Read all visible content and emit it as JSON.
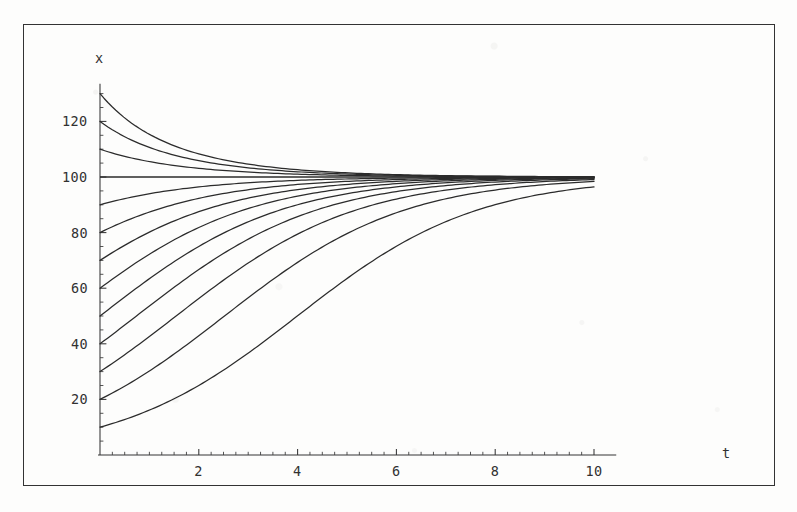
{
  "figure": {
    "kind": "scanned-figure",
    "frame": {
      "x": 23,
      "y": 24,
      "width": 752,
      "height": 462
    }
  },
  "axes": {
    "x_title": "t",
    "y_title": "x",
    "x_title_pos": {
      "x": 722,
      "y": 445
    },
    "y_title_pos": {
      "x": 95,
      "y": 50
    },
    "origin_px": {
      "x": 100,
      "y": 455
    },
    "px_per_x_unit": 49.4,
    "px_per_y_unit": 2.78,
    "x_tick_labels": [
      "2",
      "4",
      "6",
      "8",
      "10"
    ],
    "x_tick_values": [
      2,
      4,
      6,
      8,
      10
    ],
    "y_tick_labels": [
      "20",
      "40",
      "60",
      "80",
      "100",
      "120"
    ],
    "y_tick_values": [
      20,
      40,
      60,
      80,
      100,
      120
    ],
    "x_minor_step": 0.25,
    "y_minor_step": 5
  },
  "chart_data": {
    "type": "line",
    "title": "",
    "subtitle": "",
    "xlabel": "t",
    "ylabel": "x",
    "xlim": [
      0,
      10.3
    ],
    "ylim": [
      0,
      133
    ],
    "grid": false,
    "legend": "none",
    "annotations": [],
    "model": {
      "equation": "dx/dt = r x (1 - x/K)",
      "carrying_capacity": 100,
      "growth_rate": 0.55
    },
    "x": [
      0,
      0.5,
      1,
      1.5,
      2,
      2.5,
      3,
      3.5,
      4,
      4.5,
      5,
      5.5,
      6,
      6.5,
      7,
      7.5,
      8,
      8.5,
      9,
      9.5,
      10
    ],
    "series": [
      {
        "name": "x0 = 130",
        "initial_value": 130,
        "values": [
          130,
          126.2,
          122.8,
          119.9,
          117.3,
          115.1,
          113.2,
          111.5,
          110.1,
          108.8,
          107.7,
          106.8,
          106.0,
          105.2,
          104.6,
          104.1,
          103.6,
          103.2,
          102.8,
          102.5,
          102.2
        ]
      },
      {
        "name": "x0 = 120",
        "initial_value": 120,
        "values": [
          120,
          117.5,
          115.2,
          113.2,
          111.4,
          109.8,
          108.4,
          107.2,
          106.1,
          105.2,
          104.4,
          103.7,
          103.1,
          102.6,
          102.1,
          101.8,
          101.5,
          101.2,
          101.0,
          100.8,
          100.7
        ]
      },
      {
        "name": "x0 = 110",
        "initial_value": 110,
        "values": [
          110,
          108.7,
          107.5,
          106.4,
          105.5,
          104.6,
          103.9,
          103.2,
          102.7,
          102.2,
          101.8,
          101.4,
          101.1,
          100.9,
          100.7,
          100.5,
          100.4,
          100.3,
          100.2,
          100.2,
          100.1
        ]
      },
      {
        "name": "x0 = 100 (equilibrium)",
        "initial_value": 100,
        "values": [
          100,
          100,
          100,
          100,
          100,
          100,
          100,
          100,
          100,
          100,
          100,
          100,
          100,
          100,
          100,
          100,
          100,
          100,
          100,
          100,
          100
        ]
      },
      {
        "name": "x0 = 90",
        "initial_value": 90,
        "values": [
          90,
          91.1,
          92.1,
          93.0,
          93.8,
          94.6,
          95.2,
          95.8,
          96.3,
          96.8,
          97.2,
          97.6,
          97.9,
          98.2,
          98.4,
          98.6,
          98.8,
          99.0,
          99.1,
          99.3,
          99.4
        ]
      },
      {
        "name": "x0 = 80",
        "initial_value": 80,
        "values": [
          80,
          82.0,
          83.9,
          85.6,
          87.1,
          88.5,
          89.8,
          90.9,
          91.9,
          92.8,
          93.6,
          94.3,
          94.9,
          95.5,
          96.0,
          96.4,
          96.8,
          97.1,
          97.4,
          97.7,
          97.9
        ]
      },
      {
        "name": "x0 = 70",
        "initial_value": 70,
        "values": [
          70,
          72.8,
          75.5,
          78.0,
          80.3,
          82.4,
          84.3,
          86.1,
          87.6,
          89.0,
          90.2,
          91.3,
          92.3,
          93.1,
          93.9,
          94.5,
          95.1,
          95.6,
          96.1,
          96.5,
          96.8
        ]
      },
      {
        "name": "x0 = 60",
        "initial_value": 60,
        "values": [
          60,
          63.3,
          66.5,
          69.6,
          72.5,
          75.2,
          77.7,
          80.0,
          82.1,
          84.0,
          85.7,
          87.2,
          88.6,
          89.8,
          90.9,
          91.8,
          92.7,
          93.4,
          94.1,
          94.6,
          95.1
        ]
      },
      {
        "name": "x0 = 50",
        "initial_value": 50,
        "values": [
          50,
          53.4,
          56.8,
          60.2,
          63.4,
          66.5,
          69.4,
          72.2,
          74.7,
          77.0,
          79.2,
          81.1,
          82.9,
          84.5,
          85.9,
          87.2,
          88.3,
          89.3,
          90.2,
          91.0,
          91.8
        ]
      },
      {
        "name": "x0 = 40",
        "initial_value": 40,
        "values": [
          40,
          43.2,
          46.5,
          49.8,
          53.1,
          56.3,
          59.4,
          62.4,
          65.2,
          67.9,
          70.3,
          72.6,
          74.7,
          76.7,
          78.4,
          80.0,
          81.5,
          82.8,
          84.0,
          85.1,
          86.0
        ]
      },
      {
        "name": "x0 = 30",
        "initial_value": 30,
        "values": [
          30,
          32.7,
          35.5,
          38.4,
          41.4,
          44.4,
          47.4,
          50.4,
          53.3,
          56.2,
          58.9,
          61.5,
          64.0,
          66.3,
          68.5,
          70.5,
          72.4,
          74.1,
          75.7,
          77.2,
          78.5
        ]
      },
      {
        "name": "x0 = 20",
        "initial_value": 20,
        "values": [
          20,
          22.0,
          24.2,
          26.5,
          29.0,
          31.6,
          34.3,
          37.1,
          40.0,
          42.9,
          45.8,
          48.7,
          51.6,
          54.4,
          57.1,
          59.7,
          62.2,
          64.5,
          66.7,
          68.8,
          70.7
        ]
      },
      {
        "name": "x0 = 10",
        "initial_value": 10,
        "values": [
          10,
          11.1,
          12.2,
          13.5,
          14.9,
          16.4,
          18.0,
          19.8,
          21.7,
          23.8,
          26.0,
          28.4,
          30.9,
          33.6,
          36.4,
          39.3,
          42.3,
          45.4,
          48.5,
          51.7,
          54.9
        ]
      }
    ]
  },
  "colors": {
    "ink": "#242424",
    "axis": "#2e2e2e",
    "paper": "#fdfdfc"
  }
}
